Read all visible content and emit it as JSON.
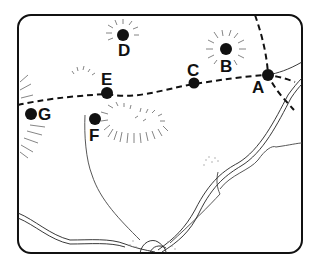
{
  "map": {
    "border_color": "#111111",
    "path_color": "#111111",
    "river_color": "#333333",
    "points": [
      {
        "id": "A",
        "label": "A",
        "x": 268,
        "y": 75,
        "lx": 257,
        "ly": 94
      },
      {
        "id": "B",
        "label": "B",
        "x": 226,
        "y": 49,
        "lx": 220,
        "ly": 72
      },
      {
        "id": "C",
        "label": "C",
        "x": 194,
        "y": 83,
        "lx": 187,
        "ly": 76
      },
      {
        "id": "D",
        "label": "D",
        "x": 123,
        "y": 35,
        "lx": 118,
        "ly": 56
      },
      {
        "id": "E",
        "label": "E",
        "x": 107,
        "y": 93,
        "lx": 101,
        "ly": 85
      },
      {
        "id": "F",
        "label": "F",
        "x": 95,
        "y": 119,
        "lx": 89,
        "ly": 140
      },
      {
        "id": "G",
        "label": "G",
        "x": 30,
        "y": 113,
        "lx": 37,
        "ly": 120
      }
    ]
  }
}
